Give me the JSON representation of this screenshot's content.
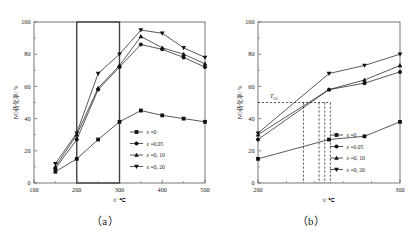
{
  "figure": {
    "caption_a": "（a）",
    "caption_b": "（b）"
  },
  "chart_data": [
    {
      "id": "panel-a",
      "type": "line",
      "title": "",
      "xlabel": "t/ ℃",
      "ylabel": "NO转化率/ %",
      "xlim": [
        100,
        500
      ],
      "ylim": [
        0,
        100
      ],
      "xticks": [
        100,
        200,
        300,
        400,
        500
      ],
      "yticks": [
        0,
        20,
        40,
        60,
        80,
        100
      ],
      "grid": false,
      "legend_position": "lower-right",
      "x": [
        150,
        200,
        250,
        300,
        350,
        400,
        450,
        500
      ],
      "series": [
        {
          "name": "x =0",
          "marker": "square",
          "values": [
            7,
            15,
            27,
            38,
            45,
            42,
            40,
            38
          ]
        },
        {
          "name": "x =0.05",
          "marker": "circle",
          "values": [
            9,
            27,
            58,
            72,
            86,
            83,
            78,
            72
          ]
        },
        {
          "name": "x =0, 10",
          "marker": "triangle-up",
          "values": [
            10,
            30,
            59,
            73,
            91,
            84,
            80,
            74
          ]
        },
        {
          "name": "x =0, 20",
          "marker": "triangle-down",
          "values": [
            12,
            31,
            68,
            80,
            95,
            93,
            84,
            78
          ]
        }
      ],
      "highlight_box": {
        "x0": 200,
        "x1": 300,
        "y0": 0,
        "y1": 100
      }
    },
    {
      "id": "panel-b",
      "type": "line",
      "title": "",
      "xlabel": "t/ ℃",
      "ylabel": "NO转化率/ %",
      "xlim": [
        200,
        300
      ],
      "ylim": [
        0,
        100
      ],
      "xticks": [
        200,
        300
      ],
      "yticks": [
        0,
        20,
        40,
        60,
        80,
        100
      ],
      "grid": false,
      "legend_position": "lower-right",
      "x": [
        200,
        250,
        275,
        300
      ],
      "series": [
        {
          "name": "x =0",
          "marker": "square",
          "values": [
            15,
            27,
            29,
            38
          ]
        },
        {
          "name": "x =0.05",
          "marker": "circle",
          "values": [
            27,
            58,
            62,
            69
          ]
        },
        {
          "name": "x =0, 10",
          "marker": "triangle-up",
          "values": [
            30,
            58,
            64,
            73
          ]
        },
        {
          "name": "x =0, 20",
          "marker": "triangle-down",
          "values": [
            31,
            68,
            73,
            80
          ]
        }
      ],
      "annotation": {
        "label": "T",
        "sub": "50",
        "y_value": 50,
        "x_values": [
          232,
          243,
          247,
          251
        ]
      }
    }
  ]
}
